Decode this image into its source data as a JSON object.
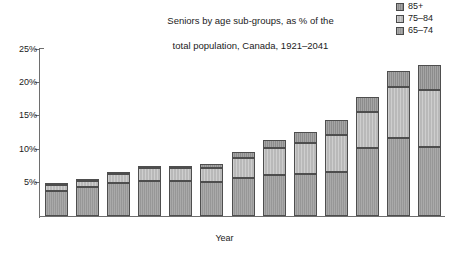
{
  "chart_data": {
    "type": "bar",
    "stacked": true,
    "title": "Seniors by age sub-groups, as % of the\ntotal population, Canada, 1921–2041",
    "title_line1": "Seniors by age sub-groups, as % of the",
    "title_line2": "total population, Canada, 1921–2041",
    "xlabel": "Year",
    "ylabel": "",
    "categories": [
      "1921",
      "1931",
      "1941",
      "1951",
      "1961",
      "1971",
      "1981",
      "1991",
      "2001",
      "2011",
      "2021",
      "2031",
      "2041"
    ],
    "series": [
      {
        "name": "65–74",
        "color": "#979797",
        "values": [
          3.8,
          4.3,
          4.9,
          5.3,
          5.2,
          5.1,
          5.8,
          6.2,
          6.4,
          6.7,
          10.3,
          11.8,
          10.4
        ]
      },
      {
        "name": "75–84",
        "color": "#b9b9b9",
        "values": [
          0.9,
          1.0,
          1.4,
          1.9,
          2.0,
          2.2,
          3.0,
          4.0,
          4.6,
          5.5,
          5.4,
          7.6,
          8.6
        ]
      },
      {
        "name": "85+",
        "color": "#8c8c8c",
        "values": [
          0.1,
          0.2,
          0.3,
          0.4,
          0.4,
          0.6,
          0.9,
          1.2,
          1.6,
          2.3,
          2.2,
          2.4,
          3.7
        ]
      }
    ],
    "totals": [
      4.8,
      5.5,
      6.6,
      7.6,
      7.6,
      7.9,
      9.7,
      11.4,
      12.6,
      14.5,
      17.9,
      21.8,
      22.7
    ],
    "ylim": [
      0,
      25
    ],
    "yticks": [
      5,
      10,
      15,
      20,
      25
    ],
    "ytick_labels": [
      "5%",
      "10%",
      "15%",
      "20%",
      "25%"
    ],
    "grid": false,
    "legend_position": "top-right",
    "legend_order": [
      "85+",
      "75–84",
      "65–74"
    ]
  },
  "legend": {
    "items": [
      {
        "label": "85+",
        "swatch": "fill-85",
        "color": "#8c8c8c"
      },
      {
        "label": "75–84",
        "swatch": "fill-7584",
        "color": "#b9b9b9"
      },
      {
        "label": "65–74",
        "swatch": "fill-6574",
        "color": "#979797"
      }
    ]
  }
}
